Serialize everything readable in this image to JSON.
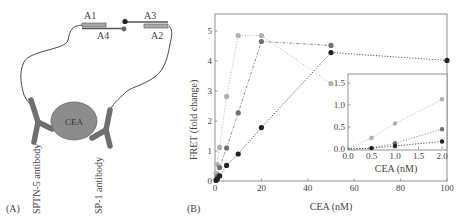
{
  "panel_a": {
    "label": "(A)",
    "strand_labels": {
      "a1": "A1",
      "a2": "A2",
      "a3": "A3",
      "a4": "A4"
    },
    "antigen_label": "CEA",
    "antibody_left": "SPTN-5 antibody",
    "antibody_right": "SP-1 antibody",
    "colors": {
      "strand_fill": "#a8a8a8",
      "strand_line": "#555555",
      "antigen": "#8c8c8c",
      "antibody": "#6f6f6f",
      "donor_dot": "#222222",
      "acceptor_dot": "#555555"
    }
  },
  "panel_b": {
    "label": "(B)",
    "main_axis": {
      "xlabel": "CEA (nM)",
      "ylabel": "FRET (fold change)",
      "xticks": [
        "0",
        "20",
        "40",
        "60",
        "80",
        "100"
      ],
      "yticks": [
        "0",
        "1",
        "2",
        "3",
        "4",
        "5"
      ]
    },
    "inset_axis": {
      "xlabel": "CEA (nM)",
      "xticks": [
        "0.0",
        "0.5",
        "1.0",
        "1.5",
        "2.0"
      ],
      "yticks": [
        "0.0",
        "0.5",
        "1.0",
        "1.5"
      ]
    }
  },
  "chart_data": [
    {
      "type": "line",
      "title": "",
      "xlabel": "CEA (nM)",
      "ylabel": "FRET (fold change)",
      "xlim": [
        0,
        100
      ],
      "ylim": [
        0,
        5.5
      ],
      "grid": false,
      "legend": "none",
      "series": [
        {
          "name": "series-light",
          "color": "#b0b0b0",
          "line": "dotted",
          "x": [
            0,
            0.5,
            1,
            2,
            5,
            10,
            20,
            50
          ],
          "values": [
            0,
            0.25,
            0.55,
            1.12,
            2.82,
            4.85,
            4.85,
            3.25
          ]
        },
        {
          "name": "series-mid",
          "color": "#707070",
          "line": "dash-dot",
          "x": [
            0,
            0.5,
            1,
            2,
            5,
            10,
            20,
            50
          ],
          "values": [
            0,
            0.05,
            0.15,
            0.45,
            1.1,
            2.27,
            4.65,
            4.52
          ]
        },
        {
          "name": "series-dark",
          "color": "#222222",
          "line": "dotted",
          "x": [
            0,
            0.5,
            1,
            2,
            5,
            10,
            20,
            50,
            100
          ],
          "values": [
            0,
            0.02,
            0.07,
            0.17,
            0.52,
            0.9,
            1.78,
            4.28,
            4.02
          ]
        }
      ]
    },
    {
      "type": "line",
      "title": "inset",
      "xlabel": "CEA (nM)",
      "ylabel": "",
      "xlim": [
        0,
        2.1
      ],
      "ylim": [
        0,
        1.6
      ],
      "grid": false,
      "legend": "none",
      "series": [
        {
          "name": "series-light",
          "color": "#b0b0b0",
          "x": [
            0,
            0.5,
            1,
            2
          ],
          "values": [
            0,
            0.25,
            0.58,
            1.13
          ]
        },
        {
          "name": "series-mid",
          "color": "#707070",
          "x": [
            0,
            0.5,
            1,
            2
          ],
          "values": [
            0,
            0.02,
            0.13,
            0.45
          ]
        },
        {
          "name": "series-dark",
          "color": "#222222",
          "x": [
            0,
            0.5,
            1,
            2
          ],
          "values": [
            0,
            0.02,
            0.07,
            0.17
          ]
        }
      ]
    }
  ]
}
